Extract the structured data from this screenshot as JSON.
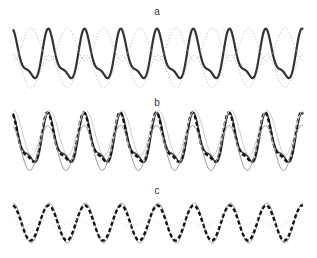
{
  "panels": [
    {
      "label": "a"
    },
    {
      "label": "b"
    },
    {
      "label": "c"
    }
  ],
  "chart_data": [
    {
      "type": "line",
      "title": "a",
      "note": "Curve parameters are approximate, estimated visually from the image; there are no axes or numeric data in the original figure.",
      "x_range_px": [
        13,
        303
      ],
      "y_range_px": [
        28,
        88
      ],
      "periods": 8,
      "series": [
        {
          "name": "composite signal",
          "style": "solid",
          "color": "#333333",
          "width": 2.2,
          "components": [
            {
              "amp": 1.0,
              "freq": 1,
              "phase": 0
            },
            {
              "amp": 0.35,
              "freq": 2,
              "phase": 0.6
            }
          ]
        },
        {
          "name": "upper reference",
          "style": "dotted",
          "color": "#bbbbbb",
          "width": 1,
          "components": [
            {
              "amp": 1.0,
              "freq": 1,
              "phase": 3.14159
            }
          ],
          "band": "upper"
        },
        {
          "name": "lower reference",
          "style": "dotted",
          "color": "#bbbbbb",
          "width": 1,
          "components": [
            {
              "amp": 1.0,
              "freq": 1,
              "phase": 0
            }
          ],
          "band": "lower"
        }
      ]
    },
    {
      "type": "line",
      "title": "b",
      "note": "Curve parameters are approximate, estimated visually from the image; there are no axes or numeric data in the original figure.",
      "x_range_px": [
        13,
        303
      ],
      "y_range_px": [
        112,
        172
      ],
      "periods": 8,
      "series": [
        {
          "name": "composite signal",
          "style": "solid",
          "color": "#444444",
          "width": 1.6,
          "components": [
            {
              "amp": 1.0,
              "freq": 1,
              "phase": 0
            },
            {
              "amp": 0.35,
              "freq": 2,
              "phase": 0.6
            }
          ]
        },
        {
          "name": "estimate",
          "style": "dashed",
          "color": "#111111",
          "width": 2.4,
          "components": [
            {
              "amp": 0.8,
              "freq": 1,
              "phase": 0.15
            },
            {
              "amp": 0.25,
              "freq": 2,
              "phase": 0.8
            }
          ]
        },
        {
          "name": "reference upper",
          "style": "solid",
          "color": "#999999",
          "width": 1,
          "components": [
            {
              "amp": 0.75,
              "freq": 1,
              "phase": 0.25
            }
          ],
          "offset": -0.2
        },
        {
          "name": "reference lower",
          "style": "solid",
          "color": "#cccccc",
          "width": 1,
          "components": [
            {
              "amp": 0.75,
              "freq": 1,
              "phase": -0.1
            }
          ],
          "offset": 0.3
        }
      ]
    },
    {
      "type": "line",
      "title": "c",
      "note": "Curve parameters are approximate, estimated visually from the image; there are no axes or numeric data in the original figure.",
      "x_range_px": [
        13,
        303
      ],
      "y_range_px": [
        203,
        243
      ],
      "periods": 8,
      "series": [
        {
          "name": "reference sine",
          "style": "solid",
          "color": "#999999",
          "width": 1,
          "components": [
            {
              "amp": 1.0,
              "freq": 1,
              "phase": 0
            }
          ]
        },
        {
          "name": "estimate",
          "style": "dashed",
          "color": "#111111",
          "width": 2.4,
          "components": [
            {
              "amp": 0.88,
              "freq": 1,
              "phase": 0.1
            }
          ]
        },
        {
          "name": "faint dotted",
          "style": "dotted",
          "color": "#dddddd",
          "width": 1,
          "components": [
            {
              "amp": 0.15,
              "freq": 1,
              "phase": 1.5
            }
          ]
        }
      ]
    }
  ]
}
